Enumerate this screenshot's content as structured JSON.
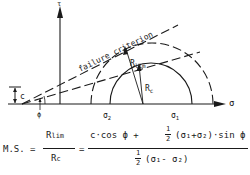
{
  "diagram": {
    "axes": {
      "y_label": "τ",
      "x_label": "σ"
    },
    "labels": {
      "failure_criterion": "failure criterion",
      "cohesion": "c",
      "friction_angle": "ϕ",
      "sigma2": "σ₂",
      "sigma1": "σ₁",
      "r_lim": "Rₗᵢₘ",
      "r_c": "R꜀"
    },
    "colors": {
      "ink": "#1a1a1a",
      "background": "#ffffff"
    }
  },
  "formula": {
    "lhs": "M.S. =",
    "frac1_num": "Rlim",
    "frac1_den": "Rc",
    "equals": "=",
    "frac2_num": "c·cos ϕ + ½ (σ1+σ2)·sin ϕ",
    "frac2_num_parts": {
      "a": "c·cos ϕ +",
      "half_num": "1",
      "half_den": "2",
      "b": "(σ₁+σ₂)·sin ϕ"
    },
    "frac2_den_parts": {
      "half_num": "1",
      "half_den": "2",
      "b": "(σ₁- σ₂)"
    }
  }
}
